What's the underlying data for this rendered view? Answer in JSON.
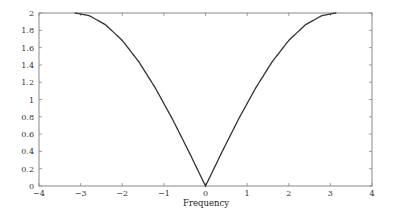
{
  "chart_data": {
    "type": "line",
    "title": "",
    "xlabel": "Frequency",
    "ylabel": "",
    "xlim": [
      -4,
      4
    ],
    "ylim": [
      0,
      2
    ],
    "grid": false,
    "legend": null,
    "x_ticks": [
      -4,
      -3,
      -2,
      -1,
      0,
      1,
      2,
      3,
      4
    ],
    "x_tick_labels": [
      "−4",
      "−3",
      "−2",
      "−1",
      "0",
      "1",
      "2",
      "3",
      "4"
    ],
    "y_ticks": [
      0,
      0.2,
      0.4,
      0.6,
      0.8,
      1,
      1.2,
      1.4,
      1.6,
      1.8,
      2
    ],
    "y_tick_labels": [
      "0",
      "0.2",
      "0.4",
      "0.6",
      "0.8",
      "1",
      "1.2",
      "1.4",
      "1.6",
      "1.8",
      "2"
    ],
    "series": [
      {
        "name": "magnitude response 2|sin(w/2)|",
        "color": "#333333",
        "x": [
          -3.1416,
          -2.8,
          -2.4,
          -2.0,
          -1.6,
          -1.2,
          -0.8,
          -0.4,
          0,
          0.4,
          0.8,
          1.2,
          1.6,
          2.0,
          2.4,
          2.8,
          3.1416
        ],
        "y": [
          2.0,
          1.971,
          1.864,
          1.683,
          1.435,
          1.129,
          0.779,
          0.397,
          0.0,
          0.397,
          0.779,
          1.129,
          1.435,
          1.683,
          1.864,
          1.971,
          2.0
        ]
      }
    ]
  }
}
